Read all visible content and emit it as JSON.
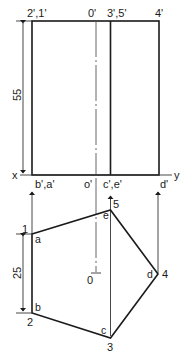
{
  "figure": {
    "type": "orthographic projection of a pentagonal prism",
    "front_view": {
      "top_labels": [
        "2',1'",
        "0'",
        "3',5'",
        "4'"
      ],
      "bottom_labels": [
        "b',a'",
        "o'",
        "c',e'",
        "d'"
      ],
      "height_dimension": "55"
    },
    "reference_line": {
      "left_label": "x",
      "right_label": "y"
    },
    "top_view": {
      "vertices": [
        {
          "number": "1",
          "letter": "a"
        },
        {
          "number": "2",
          "letter": "b"
        },
        {
          "number": "3",
          "letter": "c"
        },
        {
          "number": "4",
          "letter": "d"
        },
        {
          "number": "5",
          "letter": "e"
        }
      ],
      "center_label": "0",
      "side_dimension": "25"
    }
  },
  "colors": {
    "line": "#1a1a1a",
    "background": "#ffffff"
  }
}
